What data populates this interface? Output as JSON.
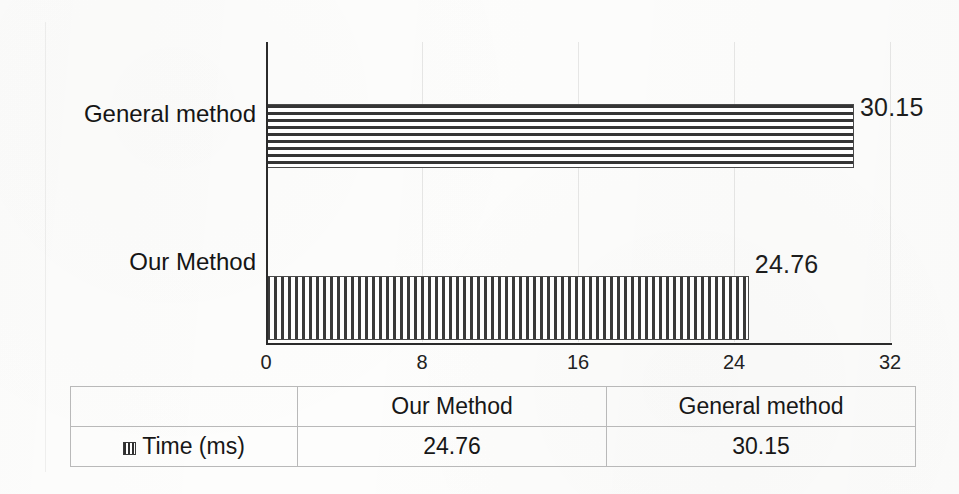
{
  "chart_data": {
    "type": "bar",
    "orientation": "horizontal",
    "title": "",
    "xlabel": "",
    "ylabel": "",
    "categories": [
      "Our Method",
      "General method"
    ],
    "values": [
      24.76,
      30.15
    ],
    "series": [
      {
        "name": "Time (ms)",
        "values": [
          24.76,
          30.15
        ]
      }
    ],
    "value_labels": [
      "24.76",
      "30.15"
    ],
    "xlim": [
      0,
      32
    ],
    "xticks": [
      0,
      8,
      16,
      24,
      32
    ],
    "xtick_labels": [
      "0",
      "8",
      "16",
      "24",
      "32"
    ],
    "grid": true,
    "grid_axis": "x",
    "legend": false,
    "units": "ms",
    "bars": [
      {
        "category": "General method",
        "value": 30.15,
        "label": "30.15",
        "pattern": "horizontal-lines",
        "row": 0
      },
      {
        "category": "Our Method",
        "value": 24.76,
        "label": "24.76",
        "pattern": "vertical-lines",
        "row": 1
      }
    ]
  },
  "axis": {
    "x_ticks": [
      {
        "label": "0",
        "value": 0
      },
      {
        "label": "8",
        "value": 8
      },
      {
        "label": "16",
        "value": 16
      },
      {
        "label": "24",
        "value": 24
      },
      {
        "label": "32",
        "value": 32
      }
    ],
    "y_categories": [
      {
        "label": "General method"
      },
      {
        "label": "Our Method"
      }
    ]
  },
  "table": {
    "corner_label": "",
    "row_header_label": "Time (ms)",
    "row_header_icon": "legend-swatch-icon",
    "column_headers": [
      "Our Method",
      "General method"
    ],
    "rows": [
      {
        "header": "Time (ms)",
        "cells": [
          "24.76",
          "30.15"
        ]
      }
    ]
  },
  "colors": {
    "background": "#fdfdfc",
    "axis": "#2b2b2b",
    "gridline": "#e3e3e3",
    "bar_ink": "#353535",
    "text": "#1a1a1a",
    "table_border": "#b9b9b9"
  }
}
